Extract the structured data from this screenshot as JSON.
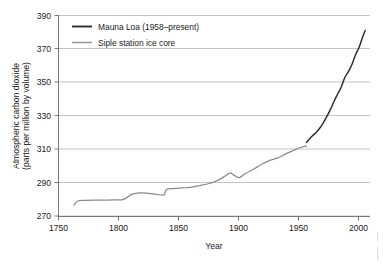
{
  "chart_data": {
    "type": "line",
    "title": "",
    "xlabel": "Year",
    "ylabel": "Atmospheric carbon dioxide (parts per million by volume)",
    "ylabel_line1": "Atmospheric carbon dioxide",
    "ylabel_line2": "(parts per million by volume)",
    "xlim": [
      1750,
      2010
    ],
    "ylim": [
      270,
      390
    ],
    "xticks": [
      1750,
      1800,
      1850,
      1900,
      1950,
      2000
    ],
    "xtick_labels": [
      "1750",
      "1800",
      "1850",
      "1900",
      "1950",
      "2000"
    ],
    "yticks": [
      270,
      290,
      310,
      330,
      350,
      370,
      390
    ],
    "ytick_labels": [
      "270",
      "290",
      "310",
      "330",
      "350",
      "370",
      "390"
    ],
    "grid": "horizontal",
    "legend_position": "top-left-inside",
    "series": [
      {
        "name": "Mauna Loa (1958–present)",
        "color": "#2b2b2b",
        "points": [
          [
            1957,
            314.0
          ],
          [
            1959,
            315.8
          ],
          [
            1962,
            318.0
          ],
          [
            1965,
            320.0
          ],
          [
            1968,
            322.5
          ],
          [
            1971,
            325.8
          ],
          [
            1974,
            329.6
          ],
          [
            1977,
            333.8
          ],
          [
            1980,
            338.7
          ],
          [
            1983,
            343.0
          ],
          [
            1986,
            347.2
          ],
          [
            1989,
            352.9
          ],
          [
            1992,
            356.4
          ],
          [
            1995,
            360.8
          ],
          [
            1998,
            366.6
          ],
          [
            2001,
            371.1
          ],
          [
            2004,
            377.5
          ],
          [
            2006,
            381.0
          ]
        ]
      },
      {
        "name": "Siple station ice core",
        "color": "#8a8a8a",
        "points": [
          [
            1763,
            276.6
          ],
          [
            1766,
            279.0
          ],
          [
            1772,
            279.4
          ],
          [
            1785,
            279.5
          ],
          [
            1798,
            279.6
          ],
          [
            1803,
            279.7
          ],
          [
            1807,
            281.0
          ],
          [
            1812,
            283.2
          ],
          [
            1818,
            283.9
          ],
          [
            1825,
            283.6
          ],
          [
            1832,
            283.0
          ],
          [
            1838,
            282.6
          ],
          [
            1840,
            285.8
          ],
          [
            1846,
            286.4
          ],
          [
            1853,
            286.8
          ],
          [
            1860,
            287.2
          ],
          [
            1868,
            288.2
          ],
          [
            1875,
            289.3
          ],
          [
            1882,
            291.0
          ],
          [
            1888,
            293.4
          ],
          [
            1893,
            295.6
          ],
          [
            1897,
            294.2
          ],
          [
            1901,
            293.0
          ],
          [
            1906,
            295.4
          ],
          [
            1913,
            298.1
          ],
          [
            1920,
            301.1
          ],
          [
            1927,
            303.4
          ],
          [
            1934,
            305.0
          ],
          [
            1940,
            307.3
          ],
          [
            1946,
            309.2
          ],
          [
            1952,
            311.0
          ],
          [
            1956,
            311.8
          ],
          [
            1957,
            311.6
          ]
        ]
      }
    ]
  },
  "legend": {
    "items": [
      {
        "label": "Mauna Loa (1958–present)",
        "swatch": "dark-line-swatch"
      },
      {
        "label": "Siple station ice core",
        "swatch": "gray-line-swatch"
      }
    ]
  },
  "colors": {
    "mauna_loa": "#2b2b2b",
    "siple": "#8a8a8a",
    "gridline": "#a9a9a9",
    "axis": "#6b6b6b",
    "background": "#ffffff"
  }
}
